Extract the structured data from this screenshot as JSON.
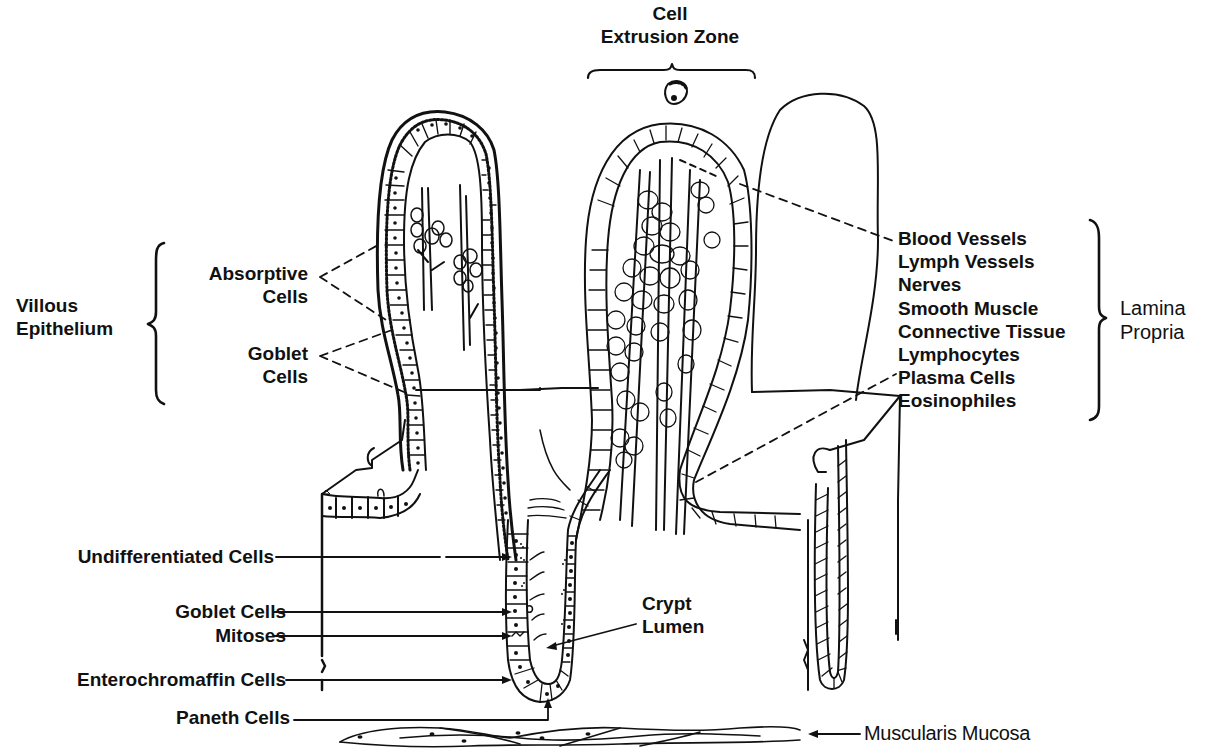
{
  "figure": {
    "type": "anatomical line drawing",
    "ink_color": "#111111",
    "background_color": "#ffffff"
  },
  "labels": {
    "cell_extrusion_zone": {
      "line1": "Cell",
      "line2": "Extrusion Zone"
    },
    "villous_epithelium": {
      "line1": "Villous",
      "line2": "Epithelium"
    },
    "absorptive_cells": {
      "line1": "Absorptive",
      "line2": "Cells"
    },
    "goblet_cells_villus": {
      "line1": "Goblet",
      "line2": "Cells"
    },
    "lamina_propria": {
      "line1": "Lamina",
      "line2": "Propria",
      "components": [
        "Blood Vessels",
        "Lymph Vessels",
        "Nerves",
        "Smooth Muscle",
        "Connective Tissue",
        "Lymphocytes",
        "Plasma Cells",
        "Eosinophiles"
      ]
    },
    "crypt_cells": [
      "Undifferentiated Cells",
      "Goblet Cells",
      "Mitoses",
      "Enterochromaffin Cells",
      "Paneth Cells"
    ],
    "crypt_lumen": {
      "line1": "Crypt",
      "line2": "Lumen"
    },
    "muscularis_mucosa": "Muscularis Mucosa"
  }
}
